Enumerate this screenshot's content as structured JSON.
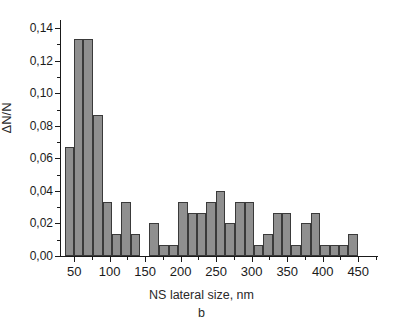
{
  "figure": {
    "caption": "b",
    "xlabel": "NS lateral size, nm",
    "ylabel": "ΔN/N"
  },
  "style": {
    "bar_fill": "#8f8f8f",
    "bar_stroke": "#3a3a3a",
    "axis_color": "#1a1a1a",
    "text_color": "#2a2a2a",
    "background": "#ffffff"
  },
  "chart_data": {
    "type": "bar",
    "title": "",
    "subtitle": "b",
    "xlabel": "NS lateral size, nm",
    "ylabel": "ΔN/N",
    "xlim": [
      30,
      475
    ],
    "ylim": [
      0.0,
      0.145
    ],
    "grid": false,
    "legend": null,
    "bin_width": 13.3,
    "y_ticks": [
      0.0,
      0.02,
      0.04,
      0.06,
      0.08,
      0.1,
      0.12,
      0.14
    ],
    "y_tick_labels": [
      "0,00",
      "0,02",
      "0,04",
      "0,06",
      "0,08",
      "0,10",
      "0,12",
      "0,14"
    ],
    "y_minor_ticks": [
      0.01,
      0.03,
      0.05,
      0.07,
      0.09,
      0.11,
      0.13
    ],
    "x_ticks": [
      50,
      100,
      150,
      200,
      250,
      300,
      350,
      400,
      450
    ],
    "x_tick_labels": [
      "50",
      "100",
      "150",
      "200",
      "250",
      "300",
      "350",
      "400",
      "450"
    ],
    "x_minor_ticks": [
      25,
      75,
      125,
      175,
      225,
      275,
      325,
      375,
      425,
      475
    ],
    "bin_centers": [
      43,
      56,
      70,
      83,
      96,
      110,
      123,
      136,
      150,
      163,
      176,
      190,
      203,
      216,
      230,
      243,
      256,
      270,
      283,
      296,
      310,
      323,
      336,
      350,
      363,
      376,
      390,
      403,
      416,
      430,
      443,
      456
    ],
    "bin_starts": [
      37,
      50,
      63,
      76,
      90,
      103,
      116,
      130,
      143,
      156,
      170,
      183,
      196,
      210,
      223,
      236,
      250,
      263,
      276,
      290,
      303,
      316,
      330,
      343,
      356,
      370,
      383,
      396,
      410,
      423,
      436,
      450
    ],
    "values": [
      0.0667,
      0.1333,
      0.1333,
      0.0867,
      0.0333,
      0.0133,
      0.0333,
      0.0133,
      0.0,
      0.02,
      0.0067,
      0.0067,
      0.0333,
      0.0267,
      0.0267,
      0.0333,
      0.04,
      0.02,
      0.0333,
      0.0333,
      0.0067,
      0.0133,
      0.0267,
      0.0267,
      0.0067,
      0.02,
      0.0267,
      0.0067,
      0.0067,
      0.0067,
      0.0133,
      0.0,
      0.0067,
      0.0,
      0.0133,
      0.0,
      0.0067,
      0.0,
      0.0067
    ],
    "series": [
      {
        "name": "ΔN/N",
        "points": [
          {
            "x": 43,
            "y": 0.0667
          },
          {
            "x": 56,
            "y": 0.1333
          },
          {
            "x": 70,
            "y": 0.1333
          },
          {
            "x": 83,
            "y": 0.0867
          },
          {
            "x": 96,
            "y": 0.0333
          },
          {
            "x": 110,
            "y": 0.0133
          },
          {
            "x": 123,
            "y": 0.0333
          },
          {
            "x": 136,
            "y": 0.0133
          },
          {
            "x": 163,
            "y": 0.02
          },
          {
            "x": 176,
            "y": 0.0067
          },
          {
            "x": 190,
            "y": 0.0067
          },
          {
            "x": 203,
            "y": 0.0333
          },
          {
            "x": 216,
            "y": 0.0267
          },
          {
            "x": 230,
            "y": 0.0267
          },
          {
            "x": 243,
            "y": 0.0333
          },
          {
            "x": 256,
            "y": 0.04
          },
          {
            "x": 270,
            "y": 0.02
          },
          {
            "x": 283,
            "y": 0.0333
          },
          {
            "x": 296,
            "y": 0.0333
          },
          {
            "x": 310,
            "y": 0.0067
          },
          {
            "x": 323,
            "y": 0.0133
          },
          {
            "x": 336,
            "y": 0.0267
          },
          {
            "x": 350,
            "y": 0.0267
          },
          {
            "x": 363,
            "y": 0.0067
          },
          {
            "x": 376,
            "y": 0.02
          },
          {
            "x": 390,
            "y": 0.0267
          },
          {
            "x": 403,
            "y": 0.0067
          },
          {
            "x": 416,
            "y": 0.0067
          },
          {
            "x": 430,
            "y": 0.0067
          },
          {
            "x": 443,
            "y": 0.0133
          },
          {
            "x": 470,
            "y": 0.0067
          },
          {
            "x": 497,
            "y": 0.0133
          },
          {
            "x": 524,
            "y": 0.0067
          },
          {
            "x": 551,
            "y": 0.0067
          }
        ]
      }
    ],
    "bars": [
      {
        "start": 37,
        "end": 50,
        "value": 0.0667
      },
      {
        "start": 50,
        "end": 63,
        "value": 0.1333
      },
      {
        "start": 63,
        "end": 76,
        "value": 0.1333
      },
      {
        "start": 76,
        "end": 90,
        "value": 0.0867
      },
      {
        "start": 90,
        "end": 103,
        "value": 0.0333
      },
      {
        "start": 103,
        "end": 116,
        "value": 0.0133
      },
      {
        "start": 116,
        "end": 130,
        "value": 0.0333
      },
      {
        "start": 130,
        "end": 143,
        "value": 0.0133
      },
      {
        "start": 156,
        "end": 170,
        "value": 0.02
      },
      {
        "start": 170,
        "end": 183,
        "value": 0.0067
      },
      {
        "start": 183,
        "end": 196,
        "value": 0.0067
      },
      {
        "start": 196,
        "end": 210,
        "value": 0.0333
      },
      {
        "start": 210,
        "end": 223,
        "value": 0.0267
      },
      {
        "start": 223,
        "end": 236,
        "value": 0.0267
      },
      {
        "start": 236,
        "end": 250,
        "value": 0.0333
      },
      {
        "start": 250,
        "end": 263,
        "value": 0.04
      },
      {
        "start": 263,
        "end": 276,
        "value": 0.02
      },
      {
        "start": 276,
        "end": 290,
        "value": 0.0333
      },
      {
        "start": 290,
        "end": 303,
        "value": 0.0333
      },
      {
        "start": 303,
        "end": 316,
        "value": 0.0067
      },
      {
        "start": 316,
        "end": 330,
        "value": 0.0133
      },
      {
        "start": 330,
        "end": 343,
        "value": 0.0267
      },
      {
        "start": 343,
        "end": 356,
        "value": 0.0267
      },
      {
        "start": 356,
        "end": 370,
        "value": 0.0067
      },
      {
        "start": 370,
        "end": 383,
        "value": 0.02
      },
      {
        "start": 383,
        "end": 396,
        "value": 0.0267
      },
      {
        "start": 396,
        "end": 410,
        "value": 0.0067
      },
      {
        "start": 410,
        "end": 423,
        "value": 0.0067
      },
      {
        "start": 423,
        "end": 436,
        "value": 0.0067
      },
      {
        "start": 436,
        "end": 450,
        "value": 0.0133
      },
      {
        "start": 463,
        "end": 476,
        "value": 0.0067
      },
      {
        "start": 490,
        "end": 503,
        "value": 0.0133
      },
      {
        "start": 516,
        "end": 530,
        "value": 0.0067
      },
      {
        "start": 543,
        "end": 556,
        "value": 0.0067
      }
    ]
  }
}
